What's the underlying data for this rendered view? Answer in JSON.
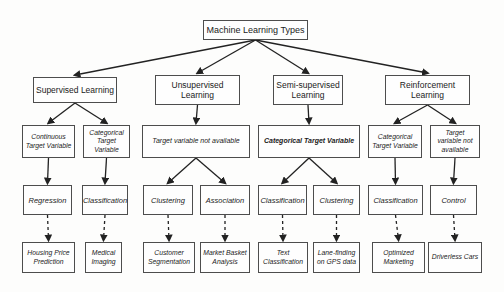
{
  "colors": {
    "background": "#fdfdfc",
    "box_border": "#4d4d4d",
    "text": "#1b1b1b",
    "line": "#222222"
  },
  "diagram": {
    "root": {
      "label": "Machine Learning Types"
    },
    "branches": {
      "supervised": {
        "label": "Supervised Learning",
        "continuous": {
          "label": "Continuous Target Variable",
          "method": "Regression",
          "example": "Housing Price Prediction"
        },
        "categorical": {
          "label": "Categorical Target Variable",
          "method": "Classification",
          "example": "Medical Imaging"
        }
      },
      "unsupervised": {
        "label": "Unsupervised Learning",
        "condition": "Target variable not available",
        "clustering": {
          "method": "Clustering",
          "example": "Customer Segmentation"
        },
        "association": {
          "method": "Association",
          "example": "Market Basket Analysis"
        }
      },
      "semi_supervised": {
        "label": "Semi-supervised Learning",
        "condition": "Categorical Target Variable",
        "classification": {
          "method": "Classification",
          "example": "Text Classification"
        },
        "clustering": {
          "method": "Clustering",
          "example": "Lane-finding on GPS data"
        }
      },
      "reinforcement": {
        "label": "Reinforcement Learning",
        "categorical": {
          "label": "Categorical Target Variable",
          "method": "Classification",
          "example": "Optimized Marketing"
        },
        "no_target": {
          "label": "Target variable not available",
          "method": "Control",
          "example": "Driverless Cars"
        }
      }
    }
  }
}
